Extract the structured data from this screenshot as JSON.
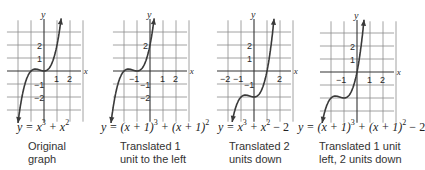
{
  "axis_labels": {
    "x": "x",
    "y": "y"
  },
  "panels": [
    {
      "id": "original",
      "equation": {
        "parts": [
          "y = x",
          "3",
          " + x",
          "2",
          ""
        ]
      },
      "equation_text": "y = x^3 + x^2",
      "caption_line1": "Original",
      "caption_line2": "graph",
      "shift": {
        "h": 0,
        "k": 0
      },
      "tick_labels": {
        "x": [
          "1",
          "2"
        ],
        "y": [
          "2",
          "1",
          "−1",
          "−2"
        ]
      }
    },
    {
      "id": "left-1",
      "equation": {
        "parts": [
          "y = (x + 1)",
          "3",
          " + (x + 1)",
          "2",
          ""
        ]
      },
      "equation_text": "y = (x + 1)^3 + (x + 1)^2",
      "caption_line1": "Translated 1",
      "caption_line2": "unit to the left",
      "shift": {
        "h": -1,
        "k": 0
      },
      "tick_labels": {
        "x": [
          "−1",
          "1",
          "2"
        ],
        "y": [
          "2",
          "−1",
          "−2"
        ]
      }
    },
    {
      "id": "down-2",
      "equation": {
        "parts": [
          "y = x",
          "3",
          " + x",
          "2",
          " − 2"
        ]
      },
      "equation_text": "y = x^3 + x^2 − 2",
      "caption_line1": "Translated 2",
      "caption_line2": "units down",
      "shift": {
        "h": 0,
        "k": -2
      },
      "tick_labels": {
        "x": [
          "−2",
          "−1",
          "2"
        ],
        "y": [
          "2",
          "1",
          "−1"
        ]
      }
    },
    {
      "id": "left-1-down-2",
      "equation": {
        "parts": [
          "y = (x + 1)",
          "3",
          " + (x + 1)",
          "2",
          " − 2"
        ]
      },
      "equation_text": "y = (x + 1)^3 + (x + 1)^2 − 2",
      "caption_line1": "Translated 1 unit",
      "caption_line2": "left, 2 units down",
      "shift": {
        "h": -1,
        "k": -2
      },
      "tick_labels": {
        "x": [
          "−1",
          "1",
          "2"
        ],
        "y": [
          "2",
          "1"
        ]
      }
    }
  ],
  "colors": {
    "grid": "#8a8a8a",
    "axis": "#333333",
    "curve": "#3a3a3a",
    "text": "#2a2a2a"
  }
}
